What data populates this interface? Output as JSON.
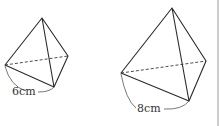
{
  "figures": [
    {
      "name": "small-tetrahedron",
      "edge_label": "6cm",
      "vertices": {
        "apex": [
          42,
          18
        ],
        "left": [
          5,
          65
        ],
        "bottom": [
          54,
          87
        ],
        "right": [
          68,
          56
        ]
      },
      "label_pos": [
        12,
        95
      ],
      "arc": "M5,66 Q10,86 26,91 M38,92 Q50,92 54,87"
    },
    {
      "name": "large-tetrahedron",
      "edge_label": "8cm",
      "vertices": {
        "apex": [
          172,
          8
        ],
        "left": [
          121,
          73
        ],
        "bottom": [
          189,
          101
        ],
        "right": [
          206,
          61
        ]
      },
      "label_pos": [
        137,
        112
      ],
      "arc": "M121,74 Q126,100 136,108 M164,109 Q182,110 189,101"
    }
  ],
  "colors": {
    "line": "#2a2a2a",
    "border": "#9a9a9a",
    "background": "#ffffff"
  },
  "right_border_x": 218
}
